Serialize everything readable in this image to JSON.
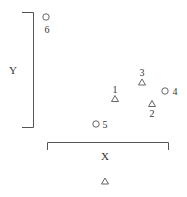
{
  "diagram": {
    "axis_labels": {
      "y": "Y",
      "x": "X"
    },
    "points": [
      {
        "id": "1",
        "shape": "triangle",
        "x": 115,
        "y": 99
      },
      {
        "id": "2",
        "shape": "triangle",
        "x": 152,
        "y": 104
      },
      {
        "id": "3",
        "shape": "triangle",
        "x": 142,
        "y": 82
      },
      {
        "id": "4",
        "shape": "circle",
        "x": 164,
        "y": 91
      },
      {
        "id": "5",
        "shape": "circle",
        "x": 96,
        "y": 124
      },
      {
        "id": "6",
        "shape": "circle",
        "x": 46,
        "y": 17
      }
    ],
    "legend_marker": {
      "shape": "triangle",
      "x": 105,
      "y": 181
    },
    "colors": {
      "stroke": "#555555",
      "text": "#333333"
    }
  }
}
